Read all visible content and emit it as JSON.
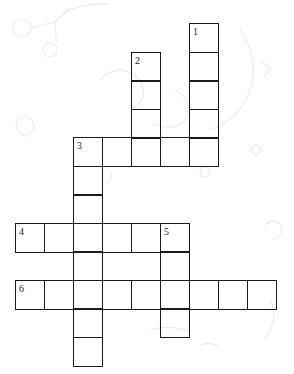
{
  "puzzle": {
    "type": "crossword",
    "cell_size": 29,
    "origin": {
      "x": 15,
      "y": 23
    },
    "line_color": "#1a1a1a",
    "background": "#ffffff",
    "entries": [
      {
        "number": "1",
        "direction": "down",
        "col": 6,
        "row": 0,
        "length": 5
      },
      {
        "number": "2",
        "direction": "down",
        "col": 4,
        "row": 1,
        "length": 4
      },
      {
        "number": "3",
        "direction": "across",
        "col": 2,
        "row": 4,
        "length": 5
      },
      {
        "number": "3",
        "direction": "down",
        "col": 2,
        "row": 4,
        "length": 8
      },
      {
        "number": "4",
        "direction": "across",
        "col": 0,
        "row": 7,
        "length": 6
      },
      {
        "number": "5",
        "direction": "down",
        "col": 5,
        "row": 7,
        "length": 4
      },
      {
        "number": "6",
        "direction": "across",
        "col": 0,
        "row": 9,
        "length": 9
      }
    ],
    "clue_numbers": [
      {
        "number": "1",
        "col": 6,
        "row": 0
      },
      {
        "number": "2",
        "col": 4,
        "row": 1
      },
      {
        "number": "3",
        "col": 2,
        "row": 4
      },
      {
        "number": "4",
        "col": 0,
        "row": 7
      },
      {
        "number": "5",
        "col": 5,
        "row": 7
      },
      {
        "number": "6",
        "col": 0,
        "row": 9
      }
    ]
  }
}
